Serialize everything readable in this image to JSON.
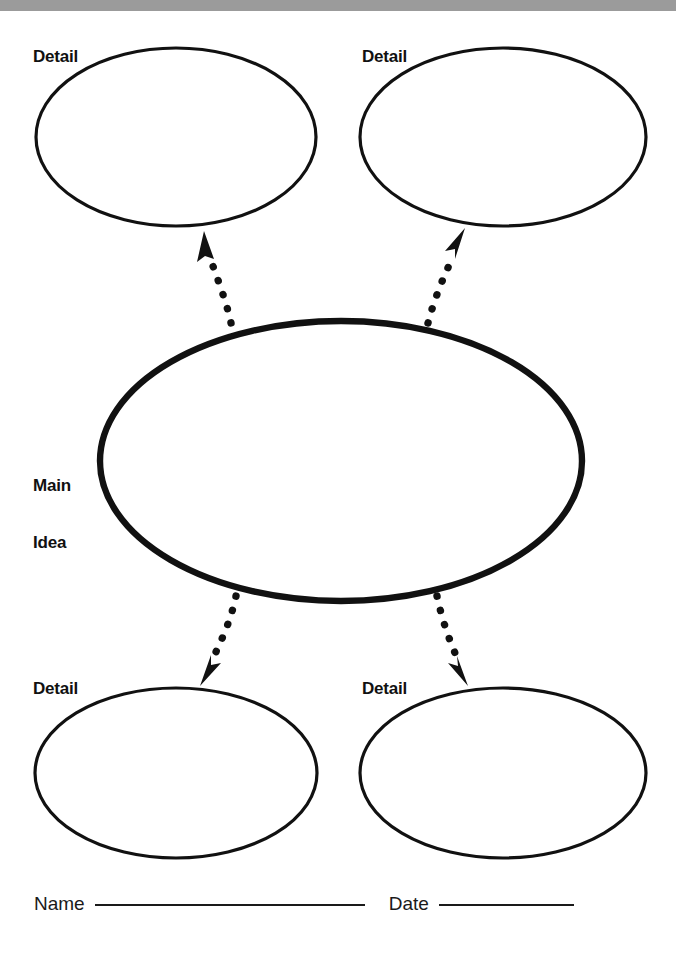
{
  "page": {
    "background_color": "#ffffff",
    "top_bar_color": "#9b9b9b",
    "ink_color": "#111111",
    "width": 676,
    "height": 966
  },
  "nodes": {
    "main": {
      "label_line1": "Main",
      "label_line2": "Idea"
    },
    "details": [
      {
        "id": "detail-top-left",
        "label": "Detail"
      },
      {
        "id": "detail-top-right",
        "label": "Detail"
      },
      {
        "id": "detail-bottom-left",
        "label": "Detail"
      },
      {
        "id": "detail-bottom-right",
        "label": "Detail"
      }
    ]
  },
  "connectors": [
    {
      "id": "arrow-to-top-left",
      "style": "dotted",
      "direction": "up-left"
    },
    {
      "id": "arrow-to-top-right",
      "style": "dotted",
      "direction": "up-right"
    },
    {
      "id": "arrow-to-bottom-left",
      "style": "dotted",
      "direction": "down-left"
    },
    {
      "id": "arrow-to-bottom-right",
      "style": "dotted",
      "direction": "down-right"
    }
  ],
  "footer": {
    "name_label": "Name",
    "date_label": "Date"
  }
}
